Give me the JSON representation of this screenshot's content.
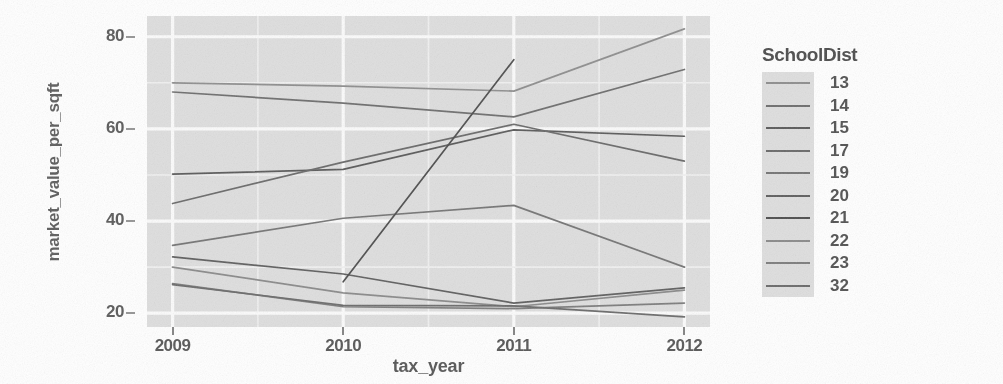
{
  "chart_data": {
    "type": "line",
    "title": "",
    "xlabel": "tax_year",
    "ylabel": "market_value_per_sqft",
    "x": [
      2009,
      2010,
      2011,
      2012
    ],
    "xtick_labels": [
      "2009",
      "2010",
      "2011",
      "2012"
    ],
    "ytick_labels": [
      "20",
      "40",
      "60",
      "80"
    ],
    "ytick_values": [
      20,
      40,
      60,
      80
    ],
    "xlim": [
      2008.85,
      2012.15
    ],
    "ylim": [
      17.0,
      84.5
    ],
    "grid": true,
    "grid_major_color": "#fbfbfb",
    "grid_minor_color": "#f0f0f0",
    "panel_background": "#dedede",
    "legend_position": "right",
    "legend_title": "SchoolDist",
    "series": [
      {
        "name": "13",
        "color": "#8e8e8e",
        "x": [
          2009,
          2010,
          2011,
          2012
        ],
        "values": [
          70.0,
          69.3,
          68.2,
          81.7
        ]
      },
      {
        "name": "14",
        "color": "#6e6e6e",
        "x": [
          2009,
          2010,
          2011,
          2012
        ],
        "values": [
          68.0,
          65.6,
          62.6,
          72.9
        ]
      },
      {
        "name": "15",
        "color": "#5a5a5a",
        "x": [
          2009,
          2010,
          2011,
          2012
        ],
        "values": [
          50.2,
          51.2,
          59.8,
          58.4
        ]
      },
      {
        "name": "17",
        "color": "#6a6a6a",
        "x": [
          2009,
          2010,
          2011,
          2012
        ],
        "values": [
          43.8,
          52.8,
          61.0,
          53.0
        ]
      },
      {
        "name": "19",
        "color": "#757575",
        "x": [
          2009,
          2010,
          2011,
          2012
        ],
        "values": [
          34.7,
          40.6,
          43.4,
          30.0
        ]
      },
      {
        "name": "20",
        "color": "#5f5f5f",
        "x": [
          2009,
          2010,
          2011,
          2012
        ],
        "values": [
          32.2,
          28.5,
          22.2,
          25.5
        ]
      },
      {
        "name": "21",
        "color": "#4e4e4e",
        "x": [
          2010,
          2011
        ],
        "values": [
          26.8,
          75.0
        ]
      },
      {
        "name": "22",
        "color": "#8a8a8a",
        "x": [
          2009,
          2010,
          2011,
          2012
        ],
        "values": [
          30.0,
          24.4,
          21.4,
          25.0
        ]
      },
      {
        "name": "23",
        "color": "#7d7d7d",
        "x": [
          2009,
          2010,
          2011,
          2012
        ],
        "values": [
          26.4,
          21.4,
          21.0,
          22.2
        ]
      },
      {
        "name": "32",
        "color": "#6b6b6b",
        "x": [
          2009,
          2010,
          2011,
          2012
        ],
        "values": [
          26.2,
          21.7,
          21.6,
          19.2
        ]
      }
    ]
  },
  "axes": {
    "x_title": "tax_year",
    "y_title": "market_value_per_sqft",
    "x_ticks": [
      "2009",
      "2010",
      "2011",
      "2012"
    ],
    "y_ticks": [
      "80",
      "60",
      "40",
      "20"
    ]
  },
  "legend": {
    "title": "SchoolDist",
    "items": [
      {
        "label": "13"
      },
      {
        "label": "14"
      },
      {
        "label": "15"
      },
      {
        "label": "17"
      },
      {
        "label": "19"
      },
      {
        "label": "20"
      },
      {
        "label": "21"
      },
      {
        "label": "22"
      },
      {
        "label": "23"
      },
      {
        "label": "32"
      }
    ]
  }
}
